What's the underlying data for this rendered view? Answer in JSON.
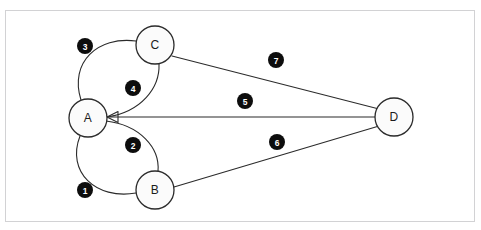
{
  "frame": {
    "border_color": "#d2d2d4",
    "background": "#ffffff"
  },
  "top_sliver": {
    "ghost_text": "•   •       •                     •"
  },
  "diagram": {
    "title": "",
    "node_fill": "#fbfbfb",
    "node_stroke": "#2b2b2b",
    "edge_stroke": "#2b2b2b",
    "badge_fill": "#0d0d0d",
    "badge_text_color": "#ffffff",
    "nodes": [
      {
        "id": "A",
        "label": "A",
        "cx": 88,
        "cy": 118,
        "r": 19
      },
      {
        "id": "B",
        "label": "B",
        "cx": 155,
        "cy": 190,
        "r": 19
      },
      {
        "id": "C",
        "label": "C",
        "cx": 155,
        "cy": 45,
        "r": 19
      },
      {
        "id": "D",
        "label": "D",
        "cx": 394,
        "cy": 117,
        "r": 19
      }
    ],
    "edges": [
      {
        "number": "1",
        "from": "A",
        "to": "B",
        "shape": "curve",
        "path": "M 80 136 C 66 172 96 200 136 193",
        "badge": {
          "cx": 85,
          "cy": 190
        }
      },
      {
        "number": "2",
        "from": "A",
        "to": "B",
        "shape": "curve",
        "path": "M 106 121 C 140 125 160 148 158 171",
        "badge": {
          "cx": 133,
          "cy": 145
        }
      },
      {
        "number": "3",
        "from": "A",
        "to": "C",
        "shape": "curve",
        "path": "M 81 100 C 69 62 98 36 136 41",
        "badge": {
          "cx": 85,
          "cy": 46
        }
      },
      {
        "number": "4",
        "from": "A",
        "to": "C",
        "shape": "curve",
        "path": "M 107 117 C 141 112 160 88 159 64",
        "badge": {
          "cx": 133,
          "cy": 88
        }
      },
      {
        "number": "5",
        "from": "A",
        "to": "D",
        "shape": "line",
        "path": "M 107 117 L 375 117",
        "badge": {
          "cx": 245,
          "cy": 101
        }
      },
      {
        "number": "6",
        "from": "B",
        "to": "D",
        "shape": "line",
        "path": "M 174 187 L 379 126",
        "badge": {
          "cx": 277,
          "cy": 142
        }
      },
      {
        "number": "7",
        "from": "C",
        "to": "D",
        "shape": "line",
        "path": "M 172 56 L 379 109",
        "badge": {
          "cx": 276,
          "cy": 60
        }
      }
    ],
    "badge_radius": 8,
    "arrowhead": {
      "x": 107,
      "y": 117
    }
  }
}
